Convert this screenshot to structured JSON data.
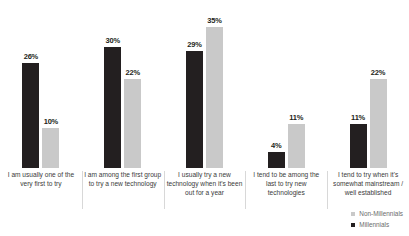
{
  "chart_data": {
    "type": "bar",
    "title": "",
    "subtitle": "",
    "xlabel": "",
    "ylabel": "",
    "ylim": [
      0,
      35
    ],
    "grid": false,
    "legend_position": "bottom-right",
    "value_suffix": "%",
    "categories": [
      "I am usually one of the very first to try",
      "I am among the first group to try a new technology",
      "I usually try a new technology when it's been out for a year",
      "I tend to be among the last to try new technologies",
      "I tend to try when it's somewhat mainstream / well established"
    ],
    "series": [
      {
        "name": "Millennials",
        "color": "#231f20",
        "values": [
          26,
          30,
          29,
          4,
          11
        ],
        "labels": [
          "26%",
          "30%",
          "29%",
          "4%",
          "11%"
        ]
      },
      {
        "name": "Non-Millennials",
        "color": "#c9c9c9",
        "values": [
          10,
          22,
          35,
          11,
          22
        ],
        "labels": [
          "10%",
          "22%",
          "35%",
          "11%",
          "22%"
        ]
      }
    ],
    "legend": [
      {
        "label": "Non-Millennials",
        "color": "#c9c9c9"
      },
      {
        "label": "Millennials",
        "color": "#231f20"
      }
    ]
  }
}
